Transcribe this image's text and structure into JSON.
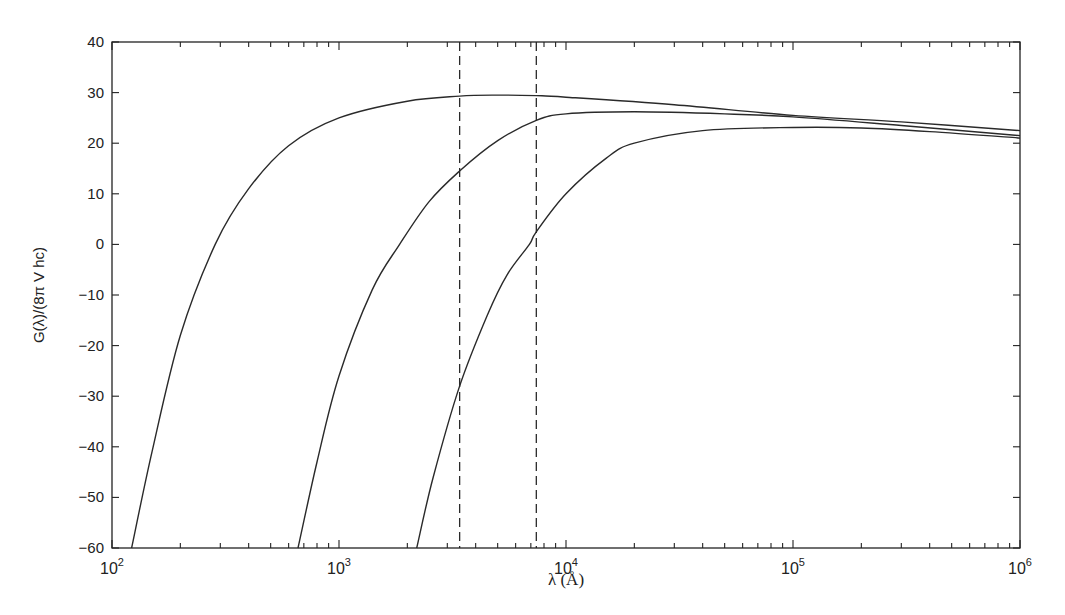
{
  "chart_data": {
    "type": "line",
    "title": "",
    "xlabel": "λ (Å)",
    "ylabel": "G(λ)/(8π V hc)",
    "xscale": "log",
    "xlim": [
      100,
      1000000
    ],
    "ylim": [
      -60,
      40
    ],
    "xticks": [
      {
        "value": 100,
        "base": "10",
        "exp": "2"
      },
      {
        "value": 1000,
        "base": "10",
        "exp": "3"
      },
      {
        "value": 10000,
        "base": "10",
        "exp": "4"
      },
      {
        "value": 100000,
        "base": "10",
        "exp": "5"
      },
      {
        "value": 1000000,
        "base": "10",
        "exp": "6"
      }
    ],
    "yticks": [
      40,
      30,
      20,
      10,
      0,
      -10,
      -20,
      -30,
      -40,
      -50,
      -60
    ],
    "grid": false,
    "legend": null,
    "vertical_dashed_lines": [
      3400,
      7400
    ],
    "series": [
      {
        "name": "curve-1",
        "x": [
          122,
          150,
          200,
          285,
          400,
          600,
          1000,
          2000,
          3400,
          5000,
          7400,
          10000,
          30000,
          100000,
          300000,
          1000000
        ],
        "y": [
          -60,
          -41,
          -18,
          0,
          11,
          19.5,
          25,
          28.3,
          29.3,
          29.5,
          29.4,
          29.1,
          27.6,
          25.5,
          24.2,
          22.5
        ]
      },
      {
        "name": "curve-2",
        "x": [
          660,
          800,
          1000,
          1400,
          1850,
          2500,
          3400,
          5000,
          7400,
          10000,
          20000,
          50000,
          100000,
          300000,
          1000000
        ],
        "y": [
          -60,
          -43,
          -26,
          -9,
          0,
          8.5,
          14.5,
          20.5,
          24.5,
          25.8,
          26.2,
          25.8,
          25.2,
          23.5,
          21.5
        ]
      },
      {
        "name": "curve-3",
        "x": [
          2200,
          2600,
          3400,
          4500,
          5500,
          6900,
          7400,
          10000,
          15000,
          20000,
          40000,
          100000,
          200000,
          400000,
          1000000
        ],
        "y": [
          -60,
          -46,
          -28,
          -14,
          -6,
          0,
          2.5,
          10,
          17,
          20,
          22.5,
          23.1,
          23,
          22.3,
          21
        ]
      }
    ]
  }
}
